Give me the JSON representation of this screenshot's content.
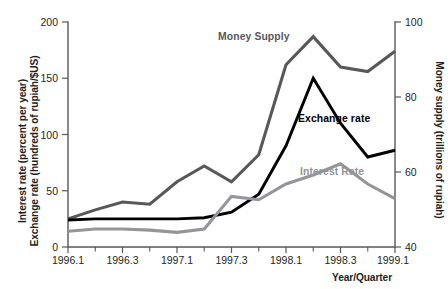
{
  "chart_data": {
    "type": "line",
    "title": "",
    "xlabel": "Year/Quarter",
    "ylabel": "Interest rate (percent per year)\nExchange rate (hundreds of rupiah/$US)",
    "ylabel_line1": "Interest rate (percent per year)",
    "ylabel_line2": "Exchange rate (hundreds of rupiah/$US)",
    "ylabel_right": "Money supply (trillions of rupiah)",
    "ylim": [
      0,
      200
    ],
    "ylim_right": [
      40,
      100
    ],
    "yticks": [
      0,
      50,
      100,
      150,
      200
    ],
    "yticks_right": [
      40,
      60,
      80,
      100
    ],
    "grid": false,
    "legend_position": "inline-annotations",
    "x": [
      "1996.1",
      "1996.2",
      "1996.3",
      "1996.4",
      "1997.1",
      "1997.2",
      "1997.3",
      "1997.4",
      "1998.1",
      "1998.2",
      "1998.3",
      "1998.4",
      "1999.1"
    ],
    "xticks_labeled": [
      "1996.1",
      "1996.3",
      "1997.1",
      "1997.3",
      "1998.1",
      "1998.3",
      "1999.1"
    ],
    "series": [
      {
        "name": "Money Supply",
        "axis": "right",
        "color": "#58585a",
        "values_right_axis": [
          47.5,
          50.0,
          52.0,
          51.3,
          57.5,
          61.5,
          57.5,
          64.5,
          88.5,
          96.0,
          88.0,
          87.0,
          92.0
        ],
        "values_left_scale": [
          25,
          33,
          40,
          38,
          58,
          72,
          58,
          82,
          162,
          187,
          160,
          156,
          174
        ]
      },
      {
        "name": "Exchange rate",
        "axis": "left",
        "color": "#000000",
        "values": [
          24,
          25,
          25,
          25,
          25,
          26,
          31,
          47,
          90,
          150,
          110,
          80,
          86
        ]
      },
      {
        "name": "Interest Rate",
        "axis": "left",
        "color": "#939598",
        "values": [
          14,
          16,
          16,
          15,
          13,
          16,
          45,
          42,
          56,
          64,
          74,
          56,
          43
        ]
      }
    ],
    "annotations": [
      {
        "text": "Money Supply",
        "color": "#58585a"
      },
      {
        "text": "Exchange rate",
        "color": "#000000"
      },
      {
        "text": "Interest Rate",
        "color": "#939598"
      }
    ]
  },
  "colors": {
    "money_supply": "#58585a",
    "exchange_rate": "#000000",
    "interest_rate": "#939598",
    "axis": "#58585a",
    "text": "#231f20",
    "background": "#ffffff"
  }
}
